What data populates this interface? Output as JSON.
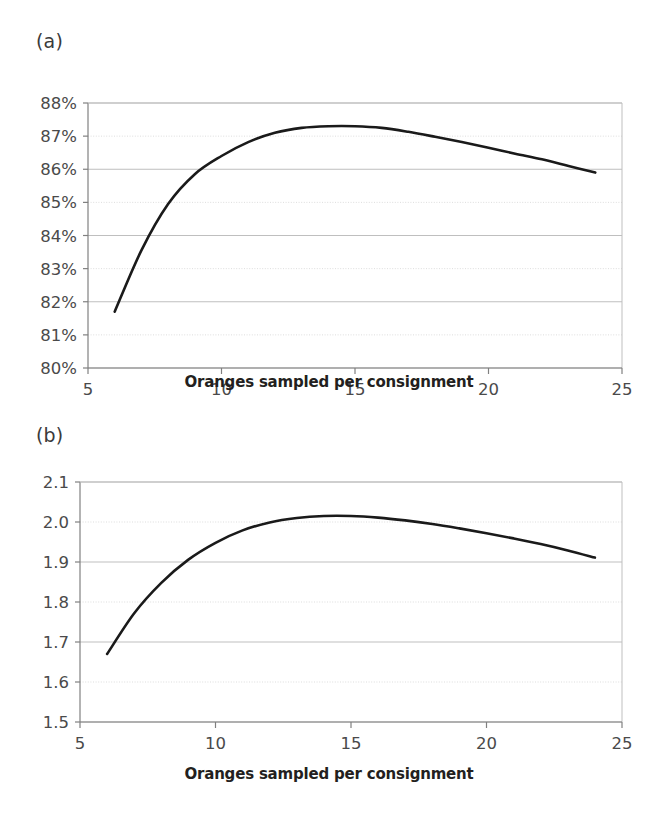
{
  "figure": {
    "panels": [
      {
        "id": "a",
        "label": "(a)",
        "xlabel": "Oranges sampled per consignment"
      },
      {
        "id": "b",
        "label": "(b)",
        "xlabel": "Oranges sampled per consignment"
      }
    ],
    "caption": ""
  },
  "colors": {
    "line": "#1a1a1a",
    "gridline_major": "#bfbfbf",
    "gridline_minor": "#d9d9d9",
    "axis": "#808080",
    "tick_text": "#4a4a4a",
    "background": "#ffffff"
  },
  "chart_data": [
    {
      "type": "line",
      "panel": "a",
      "title": "(a)",
      "xlabel": "Oranges sampled per consignment",
      "ylabel": "",
      "xlim": [
        5,
        25
      ],
      "ylim": [
        80,
        88
      ],
      "xticks": [
        5,
        10,
        15,
        20,
        25
      ],
      "xticklabels": [
        "5",
        "10",
        "15",
        "20",
        "25"
      ],
      "yticks": [
        80,
        81,
        82,
        83,
        84,
        85,
        86,
        87,
        88
      ],
      "yticklabels": [
        "80%",
        "81%",
        "82%",
        "83%",
        "84%",
        "85%",
        "86%",
        "87%",
        "88%"
      ],
      "grid": true,
      "legend": false,
      "series": [
        {
          "name": "detection effectiveness",
          "x": [
            6,
            7,
            8,
            9,
            10,
            11,
            12,
            13,
            14,
            15,
            16,
            17,
            18,
            19,
            20,
            21,
            22,
            23,
            24
          ],
          "y": [
            81.7,
            83.55,
            84.95,
            85.85,
            86.4,
            86.82,
            87.1,
            87.25,
            87.3,
            87.3,
            87.25,
            87.13,
            86.98,
            86.82,
            86.65,
            86.47,
            86.3,
            86.1,
            85.9
          ]
        }
      ],
      "annotations": {
        "peak_x": 14.5,
        "peak_y": 87.3,
        "start": [
          6,
          81.7
        ],
        "end": [
          24,
          85.9
        ]
      }
    },
    {
      "type": "line",
      "panel": "b",
      "title": "(b)",
      "xlabel": "Oranges sampled per consignment",
      "ylabel": "",
      "xlim": [
        5,
        25
      ],
      "ylim": [
        1.5,
        2.1
      ],
      "xticks": [
        5,
        10,
        15,
        20,
        25
      ],
      "xticklabels": [
        "5",
        "10",
        "15",
        "20",
        "25"
      ],
      "yticks": [
        1.5,
        1.6,
        1.7,
        1.8,
        1.9,
        2.0,
        2.1
      ],
      "yticklabels": [
        "1.5",
        "1.6",
        "1.7",
        "1.8",
        "1.9",
        "2.0",
        "2.1"
      ],
      "grid": true,
      "legend": false,
      "series": [
        {
          "name": "expected value",
          "x": [
            6,
            7,
            8,
            9,
            10,
            11,
            12,
            13,
            14,
            15,
            16,
            17,
            18,
            19,
            20,
            21,
            22,
            23,
            24
          ],
          "y": [
            1.67,
            1.772,
            1.848,
            1.906,
            1.948,
            1.979,
            1.999,
            2.01,
            2.015,
            2.015,
            2.011,
            2.004,
            1.995,
            1.984,
            1.972,
            1.959,
            1.945,
            1.929,
            1.911
          ]
        }
      ],
      "annotations": {
        "peak_x": 14.4,
        "peak_y": 2.015,
        "start": [
          6,
          1.67
        ],
        "end": [
          24,
          1.911
        ]
      }
    }
  ]
}
